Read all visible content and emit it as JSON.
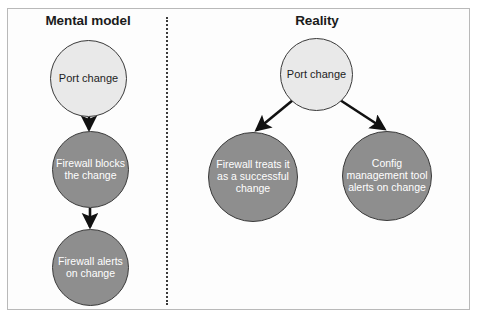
{
  "figure": {
    "panels": [
      {
        "title": "Mental model",
        "nodes": [
          {
            "label": "Port change",
            "style": "light"
          },
          {
            "label": "Firewall blocks the change",
            "style": "gray"
          },
          {
            "label": "Firewall alerts on change",
            "style": "gray"
          }
        ]
      },
      {
        "title": "Reality",
        "nodes": [
          {
            "label": "Port change",
            "style": "light"
          },
          {
            "label": "Firewall treats it as a successful change",
            "style": "gray"
          },
          {
            "label": "Config management tool alerts on change",
            "style": "gray"
          }
        ]
      }
    ],
    "colors": {
      "light_node_fill": "#e9e9e9",
      "gray_node_fill": "#8e8e8e",
      "node_stroke": "#3a3a3a",
      "light_node_text": "#1d1d1d",
      "gray_node_text": "#ffffff",
      "frame_border": "#b9b9b9",
      "divider": "#3a3a3a",
      "arrow": "#111111",
      "background": "#ffffff"
    }
  }
}
